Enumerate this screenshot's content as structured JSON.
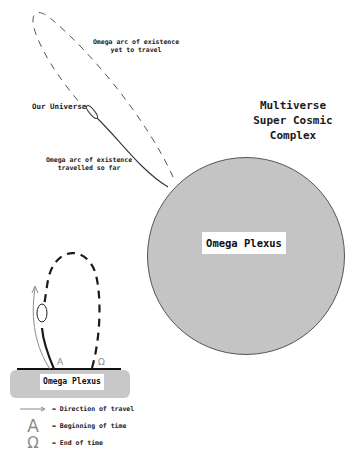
{
  "main_diagram": {
    "title_lines": [
      "Multiverse",
      "Super Cosmic",
      "Complex"
    ],
    "center_label": "Omega Plexus",
    "labels": {
      "yet_to_travel": [
        "Omega arc of existence",
        "yet to travel"
      ],
      "our_universe": "Our Universe",
      "travelled": [
        "Omega arc of existence",
        "travelled so far"
      ]
    },
    "colors": {
      "plexus_fill": "#c4c4c4",
      "plexus_stroke": "#555555",
      "arc_stroke": "#444444"
    }
  },
  "inset_diagram": {
    "base_label": "Omega Plexus",
    "alpha_glyph": "A",
    "omega_glyph": "Ω",
    "colors": {
      "base_fill": "#c8c8c8",
      "arrow": "#8a8a8a",
      "arc": "#1a1a1a"
    }
  },
  "legend": {
    "items": [
      {
        "symbol": "arrow",
        "text": "= Direction of travel"
      },
      {
        "symbol": "A",
        "text": "= Beginning of time"
      },
      {
        "symbol": "Ω",
        "text": "= End of time"
      }
    ]
  }
}
